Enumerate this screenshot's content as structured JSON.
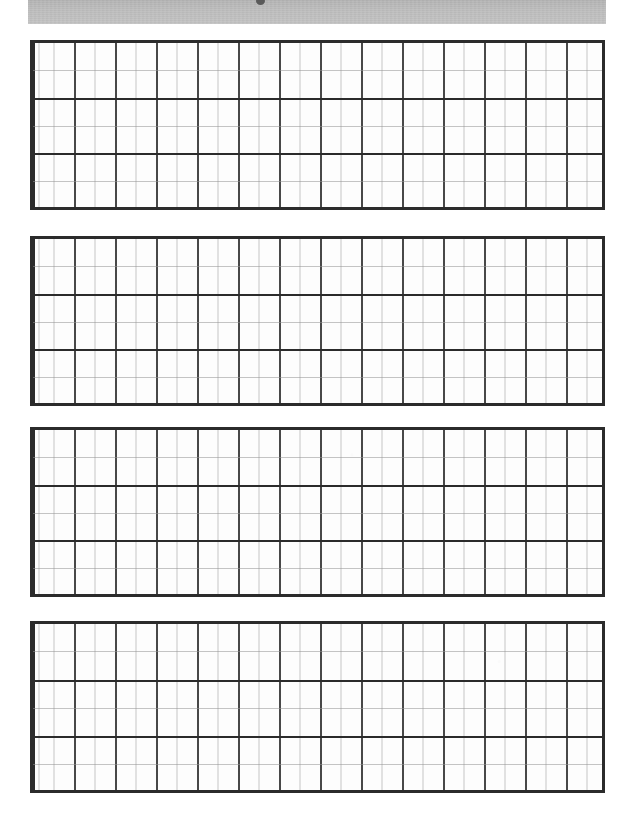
{
  "document": {
    "kind": "scanned-worksheet-page",
    "page_background": "#ffffff",
    "ink_color": "#2b2b2b",
    "minor_line_color": "#969696",
    "header_band_color": "#b8b8b8",
    "header_band_label": "",
    "artifact_label": ""
  },
  "header": {
    "band_label": "",
    "smudge_name": "scan-artifact"
  },
  "grids": [
    {
      "id": "grid-block-1",
      "label": "",
      "major_columns": 14,
      "minor_per_major_column": 2,
      "major_rows": 3,
      "minor_per_major_row": 2,
      "cells": []
    },
    {
      "id": "grid-block-2",
      "label": "",
      "major_columns": 14,
      "minor_per_major_column": 2,
      "major_rows": 3,
      "minor_per_major_row": 2,
      "cells": []
    },
    {
      "id": "grid-block-3",
      "label": "",
      "major_columns": 14,
      "minor_per_major_column": 2,
      "major_rows": 3,
      "minor_per_major_row": 2,
      "cells": []
    },
    {
      "id": "grid-block-4",
      "label": "",
      "major_columns": 14,
      "minor_per_major_column": 2,
      "major_rows": 3,
      "minor_per_major_row": 2,
      "cells": []
    }
  ]
}
